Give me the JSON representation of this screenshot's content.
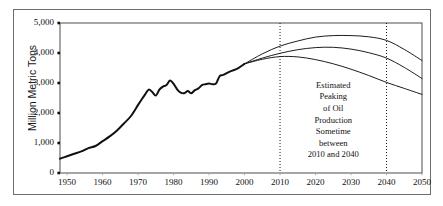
{
  "chart_data": {
    "type": "line",
    "title": "",
    "xlabel": "",
    "ylabel": "Million Metric Tons",
    "xlim": [
      1948,
      2050
    ],
    "ylim": [
      0,
      5000
    ],
    "grid": false,
    "legend_position": "none",
    "x_ticks": [
      "1950",
      "1960",
      "1970",
      "1980",
      "1990",
      "2000",
      "2010",
      "2020",
      "2030",
      "2040",
      "2050"
    ],
    "x_tick_values": [
      1950,
      1960,
      1970,
      1980,
      1990,
      2000,
      2010,
      2020,
      2030,
      2040,
      2050
    ],
    "y_ticks": [
      "0",
      "1,000",
      "2,000",
      "3,000",
      "4,000",
      "5,000"
    ],
    "y_tick_values": [
      0,
      1000,
      2000,
      3000,
      4000,
      5000
    ],
    "annotations": [
      {
        "name": "peak-oil-note",
        "lines": [
          "Estimated",
          "Peaking",
          "of Oil",
          "Production",
          "Sometime",
          "between",
          "2010 and 2040"
        ],
        "x": 2025,
        "y": 1750
      },
      {
        "name": "vertical-marker-2010",
        "type": "vline",
        "x": 2010,
        "style": "dotted"
      },
      {
        "name": "vertical-marker-2040",
        "type": "vline",
        "x": 2040,
        "style": "dotted"
      }
    ],
    "series": [
      {
        "name": "Historical Oil Production",
        "style": "solid-thick",
        "x": [
          1948,
          1950,
          1952,
          1954,
          1956,
          1958,
          1960,
          1962,
          1964,
          1966,
          1968,
          1970,
          1971,
          1972,
          1973,
          1974,
          1975,
          1976,
          1977,
          1978,
          1979,
          1980,
          1981,
          1982,
          1983,
          1984,
          1985,
          1986,
          1987,
          1988,
          1989,
          1990,
          1991,
          1992,
          1993,
          1994,
          1996,
          1998,
          2000
        ],
        "values": [
          480,
          560,
          640,
          720,
          830,
          900,
          1060,
          1220,
          1410,
          1650,
          1900,
          2270,
          2450,
          2620,
          2780,
          2700,
          2580,
          2780,
          2880,
          2930,
          3080,
          2970,
          2790,
          2680,
          2660,
          2730,
          2660,
          2760,
          2820,
          2930,
          2960,
          2980,
          2960,
          2990,
          3230,
          3270,
          3390,
          3480,
          3640
        ]
      },
      {
        "name": "High Projection (peak ~2025)",
        "style": "solid-thin",
        "x": [
          2000,
          2005,
          2010,
          2015,
          2020,
          2025,
          2030,
          2035,
          2040,
          2045,
          2050
        ],
        "values": [
          3640,
          3970,
          4230,
          4400,
          4530,
          4580,
          4580,
          4540,
          4420,
          4120,
          3750
        ]
      },
      {
        "name": "Middle Projection (peak ~2022)",
        "style": "solid-thin",
        "x": [
          2000,
          2005,
          2010,
          2015,
          2020,
          2025,
          2030,
          2035,
          2040,
          2045,
          2050
        ],
        "values": [
          3640,
          3830,
          3990,
          4110,
          4180,
          4190,
          4130,
          4010,
          3830,
          3520,
          3150
        ]
      },
      {
        "name": "Low Projection (peak ~2012)",
        "style": "solid-thin",
        "x": [
          2000,
          2005,
          2010,
          2015,
          2020,
          2025,
          2030,
          2035,
          2040,
          2045,
          2050
        ],
        "values": [
          3640,
          3790,
          3880,
          3870,
          3780,
          3640,
          3460,
          3250,
          3020,
          2820,
          2620
        ]
      }
    ]
  }
}
